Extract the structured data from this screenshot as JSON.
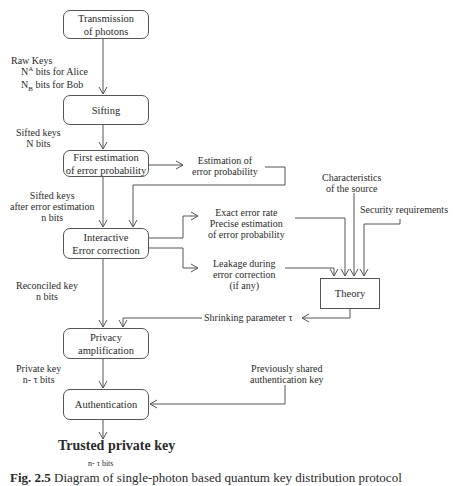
{
  "boxes": {
    "transmission": [
      "Transmission",
      "of photons"
    ],
    "sifting": "Sifting",
    "first_estimation": [
      "First estimation",
      "of error probability"
    ],
    "error_correction": [
      "Interactive",
      "Error correction"
    ],
    "privacy": [
      "Privacy",
      "amplification"
    ],
    "authentication": "Authentication",
    "theory": "Theory"
  },
  "labels": {
    "raw_keys": "Raw Keys",
    "raw_alice_sym": "N",
    "raw_alice_sub": "A",
    "raw_alice_text": "bits for Alice",
    "raw_bob_sym": "N",
    "raw_bob_sub": "B",
    "raw_bob_text": "bits for Bob",
    "sifted_keys": [
      "Sifted keys",
      "N bits"
    ],
    "sifted_after": [
      "Sifted keys",
      "after error estimation",
      "n bits"
    ],
    "reconciled": [
      "Reconciled key",
      "n bits"
    ],
    "private_key": [
      "Private key",
      "n- τ  bits"
    ],
    "estimation_error": [
      "Estimation of",
      "error probability"
    ],
    "exact_error": [
      "Exact error rate",
      "Precise estimation",
      "of error probability"
    ],
    "leakage": [
      "Leakage during",
      "error correction",
      "(if any)"
    ],
    "characteristics": [
      "Characteristics",
      "of the source"
    ],
    "security": "Security requirements",
    "shrinking": "Shrinking parameter τ",
    "prev_shared": [
      "Previously shared",
      "authentication key"
    ],
    "trusted": "Trusted private key",
    "trusted_bits": "n- τ  bits"
  },
  "caption": {
    "fig": "Fig. 2.5",
    "text": "Diagram of single-photon based quantum key distribution protocol"
  },
  "colors": {
    "line": "#555555",
    "text": "#2a2a2a"
  }
}
